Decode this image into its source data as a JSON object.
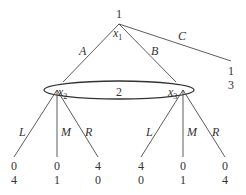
{
  "diagram": {
    "type": "extensive-form game tree",
    "root": {
      "player": "1",
      "node_label": "x",
      "node_sub": "1",
      "actions": {
        "A": "A",
        "B": "B",
        "C": "C"
      }
    },
    "terminal_C": {
      "payoff_1": "1",
      "payoff_2": "3"
    },
    "info_set": {
      "player": "2",
      "left_node": {
        "label": "x",
        "sub": "2"
      },
      "right_node": {
        "label": "x",
        "sub": "3"
      }
    },
    "left_subtree": {
      "actions": [
        "L",
        "M",
        "R"
      ],
      "payoffs": [
        {
          "p1": "0",
          "p2": "4"
        },
        {
          "p1": "0",
          "p2": "1"
        },
        {
          "p1": "4",
          "p2": "0"
        }
      ]
    },
    "right_subtree": {
      "actions": [
        "L",
        "M",
        "R"
      ],
      "payoffs": [
        {
          "p1": "4",
          "p2": "0"
        },
        {
          "p1": "0",
          "p2": "1"
        },
        {
          "p1": "0",
          "p2": "4"
        }
      ]
    }
  }
}
